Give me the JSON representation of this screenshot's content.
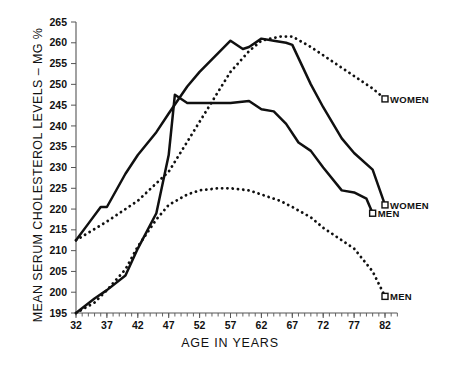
{
  "chart_data": {
    "type": "line",
    "title": "",
    "xlabel": "AGE IN YEARS",
    "ylabel": "MEAN SERUM CHOLESTEROL LEVELS – MG %",
    "xlim": [
      32,
      84
    ],
    "ylim": [
      195,
      265
    ],
    "ytick_step": 5,
    "xtick_step": 5,
    "x_minor_tick_step": 1,
    "grid": false,
    "legend_position": "right-inline-labels",
    "xticks": [
      "32",
      "37",
      "42",
      "47",
      "52",
      "57",
      "62",
      "67",
      "72",
      "77",
      "82"
    ],
    "yticks": [
      "195",
      "200",
      "205",
      "210",
      "215",
      "220",
      "225",
      "230",
      "235",
      "240",
      "245",
      "250",
      "255",
      "260",
      "265"
    ],
    "series": [
      {
        "name": "WOMEN",
        "style": "dotted",
        "label": "WOMEN",
        "x": [
          32,
          37,
          42,
          47,
          52,
          57,
          60,
          62,
          65,
          67,
          70,
          72,
          75,
          77,
          80,
          82
        ],
        "values": [
          212.5,
          217.0,
          222.0,
          229.0,
          241.0,
          253.0,
          258.0,
          260.5,
          261.5,
          261.5,
          259.0,
          257.0,
          254.0,
          252.0,
          249.0,
          246.5
        ]
      },
      {
        "name": "WOMEN",
        "style": "solid",
        "label": "WOMEN",
        "x": [
          32,
          34,
          36,
          37,
          40,
          42,
          45,
          47,
          50,
          52,
          55,
          57,
          59,
          60,
          62,
          64,
          66,
          67,
          70,
          72,
          75,
          77,
          80,
          82
        ],
        "values": [
          212.5,
          216.5,
          220.5,
          220.5,
          228.5,
          233.0,
          238.5,
          243.0,
          249.5,
          253.0,
          257.5,
          260.5,
          258.5,
          259.0,
          261.0,
          260.5,
          260.0,
          259.5,
          250.0,
          244.5,
          237.0,
          233.5,
          229.5,
          221.0
        ]
      },
      {
        "name": "MEN",
        "style": "solid",
        "label": "MEN",
        "x": [
          32,
          35,
          37,
          40,
          42,
          45,
          47,
          48,
          50,
          52,
          55,
          57,
          60,
          62,
          64,
          66,
          68,
          70,
          72,
          75,
          77,
          79,
          80
        ],
        "values": [
          195.0,
          198.5,
          200.5,
          204.0,
          210.5,
          219.0,
          233.0,
          247.5,
          245.5,
          245.5,
          245.5,
          245.5,
          246.0,
          244.0,
          243.5,
          240.5,
          236.0,
          234.0,
          230.0,
          224.5,
          224.0,
          222.5,
          219.0
        ]
      },
      {
        "name": "MEN",
        "style": "dotted",
        "label": "MEN",
        "x": [
          32,
          35,
          37,
          40,
          42,
          45,
          47,
          50,
          52,
          55,
          57,
          60,
          62,
          65,
          67,
          70,
          72,
          75,
          77,
          80,
          82
        ],
        "values": [
          195.0,
          197.5,
          200.5,
          205.5,
          211.0,
          217.5,
          221.0,
          223.5,
          224.5,
          225.0,
          225.0,
          224.5,
          223.5,
          222.0,
          220.5,
          218.0,
          215.5,
          212.5,
          210.5,
          205.0,
          199.0
        ]
      }
    ]
  },
  "labels": {
    "women_dotted": "WOMEN",
    "women_solid": "WOMEN",
    "men_solid": "MEN",
    "men_dotted": "MEN"
  },
  "colors": {
    "ink": "#101010",
    "axis": "#555555",
    "background": "#ffffff"
  }
}
